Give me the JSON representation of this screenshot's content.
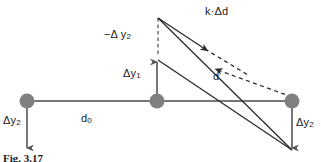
{
  "figure": {
    "caption": "Fig. 3.17",
    "colors": {
      "node_fill": "#808080",
      "line": "#666666",
      "diagonal": "#3a3a3a",
      "dashed": "#3a3a3a",
      "text": "#1a1a1a",
      "background": "#ffffff"
    },
    "labels": {
      "k_delta_d": "k·Δd",
      "neg_delta_y2": "−Δ y",
      "neg_delta_y2_sub": "2",
      "delta_y1": "Δy",
      "delta_y1_sub": "1",
      "d": "d",
      "d0": "d",
      "d0_sub": "0",
      "delta_y2_left": "Δy",
      "delta_y2_left_sub": "2",
      "delta_y2_right": "Δy",
      "delta_y2_right_sub": "2"
    },
    "nodes": [
      {
        "name": "left-node",
        "cx": 27,
        "cy": 101,
        "r": 7
      },
      {
        "name": "middle-node",
        "cx": 157,
        "cy": 101,
        "r": 7
      },
      {
        "name": "right-node",
        "cx": 292,
        "cy": 101,
        "r": 7
      }
    ],
    "geometry": {
      "baseline_y": 101,
      "baseline_x_start": 27,
      "baseline_x_end": 292,
      "delta_y1_arrow": {
        "x": 157,
        "y_from": 101,
        "y_to": 60
      },
      "dashed_vertical": {
        "x": 158,
        "y_from": 18,
        "y_to": 60
      },
      "delta_y2_left_arrow": {
        "x": 27,
        "y_from": 101,
        "y_to": 150
      },
      "delta_y2_right_arrow": {
        "x": 292,
        "y_from": 101,
        "y_to": 150
      },
      "k_delta_d_line": {
        "x1": 158,
        "y1": 18,
        "x2": 202,
        "y2": 47
      },
      "k_delta_d_dashed": {
        "x1": 202,
        "y1": 47,
        "x2": 292,
        "y2": 101
      },
      "upper_diagonal": {
        "x1": 158,
        "y1": 18,
        "x2": 292,
        "y2": 150
      },
      "lower_diagonal": {
        "x1": 158,
        "y1": 60,
        "x2": 292,
        "y2": 150
      },
      "d_dashed_arrow": {
        "x1": 292,
        "y1": 93,
        "x2": 212,
        "y2": 67
      }
    }
  }
}
